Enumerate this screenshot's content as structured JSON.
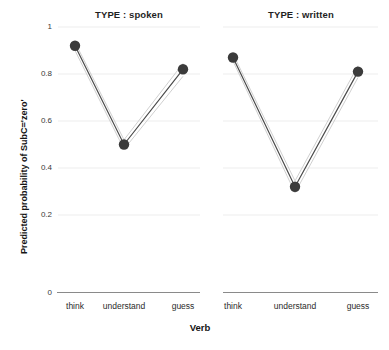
{
  "chart_data": {
    "type": "line",
    "title": "",
    "xlabel": "Verb",
    "ylabel": "Predicted probability of SubC='zero'",
    "categories": [
      "think",
      "understand",
      "guess"
    ],
    "ylim": [
      0,
      1
    ],
    "yticks": [
      0,
      0.2,
      0.4,
      0.6,
      0.8,
      1
    ],
    "ytick_labels": [
      "0",
      "0.2",
      "0.4",
      "0.6",
      "0.8",
      "1"
    ],
    "grid": true,
    "grid_color": "#e8e8e8",
    "legend": "none",
    "point_color": "#3b3b3b",
    "line_color": "#555555",
    "ci_color": "#cccccc",
    "panels": [
      {
        "title": "TYPE : spoken",
        "categories": [
          "think",
          "understand",
          "guess"
        ],
        "values": [
          0.92,
          0.5,
          0.82
        ],
        "ci_lower": [
          0.9,
          0.48,
          0.79
        ],
        "ci_upper": [
          0.935,
          0.52,
          0.845
        ]
      },
      {
        "title": "TYPE : written",
        "categories": [
          "think",
          "understand",
          "guess"
        ],
        "values": [
          0.87,
          0.32,
          0.81
        ],
        "ci_lower": [
          0.855,
          0.295,
          0.785
        ],
        "ci_upper": [
          0.885,
          0.345,
          0.835
        ]
      }
    ]
  },
  "axes": {
    "y_title": "Predicted probability of SubC='zero'",
    "x_title": "Verb",
    "ytick_0": "0",
    "ytick_1": "0.2",
    "ytick_2": "0.4",
    "ytick_3": "0.6",
    "ytick_4": "0.8",
    "ytick_5": "1"
  },
  "panel_left": {
    "title": "TYPE : spoken",
    "xtick_0": "think",
    "xtick_1": "understand",
    "xtick_2": "guess"
  },
  "panel_right": {
    "title": "TYPE : written",
    "xtick_0": "think",
    "xtick_1": "understand",
    "xtick_2": "guess"
  }
}
